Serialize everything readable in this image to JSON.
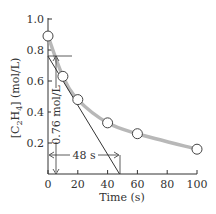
{
  "chart_data": {
    "type": "scatter",
    "title": "",
    "xlabel": "Time (s)",
    "ylabel": "[C2H4] (mol/L)",
    "ylabel_parts": {
      "pre": "[C",
      "sub1": "2",
      "mid": "H",
      "sub2": "4",
      "post": "] (mol/L)"
    },
    "xlim": [
      0,
      100
    ],
    "ylim": [
      0,
      1.0
    ],
    "xticks": [
      0,
      20,
      40,
      60,
      80,
      100
    ],
    "xtick_labels": [
      "0",
      "20",
      "40",
      "60",
      "80",
      "100"
    ],
    "yticks": [
      0.2,
      0.4,
      0.6,
      0.8,
      1.0
    ],
    "ytick_labels": [
      "0.2",
      "0.4",
      "0.6",
      "0.8",
      "1.0"
    ],
    "grid": false,
    "legend": null,
    "series": [
      {
        "name": "[C2H4] measured",
        "marker": "open-circle",
        "line": "smooth-gray",
        "x": [
          0,
          10,
          20,
          40,
          60,
          100
        ],
        "y": [
          0.89,
          0.63,
          0.48,
          0.33,
          0.26,
          0.16
        ]
      }
    ],
    "tangent_line": {
      "x": [
        0,
        48
      ],
      "y": [
        0.76,
        0
      ]
    },
    "annotations": [
      {
        "text": "0.76 mol/L",
        "type": "vertical-dimension",
        "from": 0.76,
        "to": 0,
        "at_x": 5
      },
      {
        "text": "48 s",
        "type": "horizontal-dimension",
        "from": 0,
        "to": 48,
        "at_y": 0.12
      }
    ]
  },
  "colors": {
    "curve": "#b8b8b8",
    "axis": "#333333",
    "marker_fill": "#ffffff",
    "marker_stroke": "#444444",
    "tangent": "#333333"
  }
}
